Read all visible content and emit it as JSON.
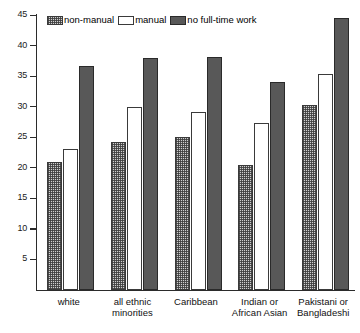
{
  "chart_data": {
    "type": "bar",
    "title": "",
    "subtitle": "",
    "xlabel": "",
    "ylabel": "",
    "ylim": [
      0,
      45
    ],
    "yticks": [
      5,
      10,
      15,
      20,
      25,
      30,
      35,
      40,
      45
    ],
    "ytick_labels": [
      "5",
      "10",
      "15",
      "20",
      "25",
      "30",
      "35",
      "40",
      "45"
    ],
    "grid": false,
    "legend_position": "top-left",
    "categories": [
      "white",
      "all ethnic minorities",
      "Caribbean",
      "Indian or African Asian",
      "Pakistani or Bangladeshi"
    ],
    "category_label_lines": [
      [
        "white"
      ],
      [
        "all ethnic",
        "minorities"
      ],
      [
        "Caribbean"
      ],
      [
        "Indian or",
        "African Asian"
      ],
      [
        "Pakistani or",
        "Bangladeshi"
      ]
    ],
    "series": [
      {
        "name": "non-manual",
        "pattern": "dotted-hatch",
        "color": "#cfcfcf",
        "values": [
          21.0,
          24.3,
          25.0,
          20.5,
          30.2
        ]
      },
      {
        "name": "manual",
        "pattern": "solid-white",
        "color": "#ffffff",
        "values": [
          23.0,
          30.0,
          29.2,
          27.4,
          35.3
        ]
      },
      {
        "name": "no full-time work",
        "pattern": "solid-dark",
        "color": "#585858",
        "values": [
          36.7,
          37.9,
          38.2,
          34.0,
          44.5
        ]
      }
    ]
  },
  "legend": {
    "items": [
      {
        "label": "non-manual"
      },
      {
        "label": "manual"
      },
      {
        "label": "no full-time work"
      }
    ]
  },
  "colors": {
    "axis": "#2b2b2b",
    "non_manual": "#cfcfcf",
    "manual": "#ffffff",
    "no_full_time_work": "#585858"
  }
}
